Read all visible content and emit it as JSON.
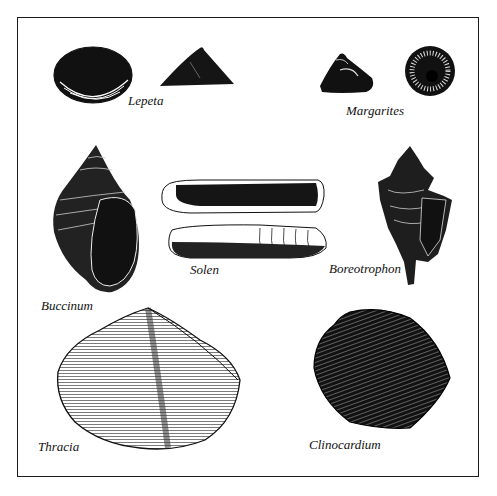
{
  "figure": {
    "colors": {
      "ink": "#111111",
      "paper": "#ffffff"
    },
    "specimens": [
      {
        "name": "Lepeta",
        "label": "Lepeta",
        "views": 2
      },
      {
        "name": "Margarites",
        "label": "Margarites",
        "views": 2
      },
      {
        "name": "Buccinum",
        "label": "Buccinum",
        "views": 1
      },
      {
        "name": "Solen",
        "label": "Solen",
        "views": 2
      },
      {
        "name": "Boreotrophon",
        "label": "Boreotrophon",
        "views": 1
      },
      {
        "name": "Thracia",
        "label": "Thracia",
        "views": 1
      },
      {
        "name": "Clinocardium",
        "label": "Clinocardium",
        "views": 1
      }
    ]
  }
}
